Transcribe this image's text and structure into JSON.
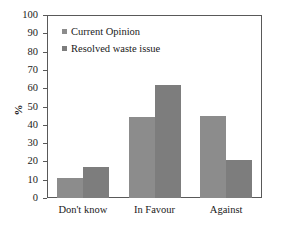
{
  "chart_data": {
    "type": "bar",
    "title": "",
    "subtitle": "",
    "xlabel": "",
    "ylabel": "%",
    "ylim": [
      0,
      100
    ],
    "ytick_step": 10,
    "yticks": [
      100,
      90,
      80,
      70,
      60,
      50,
      40,
      30,
      20,
      10,
      0
    ],
    "ytick_labels": [
      "100",
      "90",
      "80",
      "70",
      "60",
      "50",
      "40",
      "30",
      "20",
      "10",
      "0"
    ],
    "categories": [
      "Don't know",
      "In Favour",
      "Against"
    ],
    "series": [
      {
        "name": "Current Opinion",
        "values": [
          11,
          44,
          45
        ],
        "color": "#8c8c8c"
      },
      {
        "name": "Resolved waste issue",
        "values": [
          17,
          62,
          21
        ],
        "color": "#7d7d7d"
      }
    ],
    "legend": {
      "position": "top-left-inside",
      "entries": [
        "Current Opinion",
        "Resolved waste issue"
      ]
    },
    "grid": false,
    "frame": true,
    "annotations": []
  }
}
